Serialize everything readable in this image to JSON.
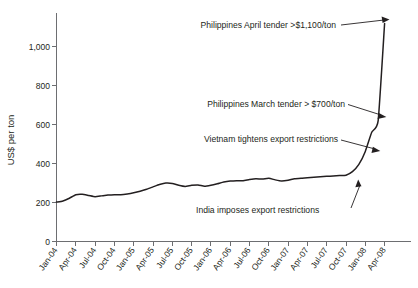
{
  "chart_data": {
    "type": "line",
    "title": "",
    "xlabel": "",
    "ylabel": "US$ per ton",
    "ylim": [
      0,
      1150
    ],
    "yticks": [
      "0",
      "200",
      "400",
      "600",
      "800",
      "1,000"
    ],
    "ytick_values": [
      0,
      200,
      400,
      600,
      800,
      1000
    ],
    "grid": false,
    "legend": "none",
    "categories": [
      "Jan-04",
      "Feb-04",
      "Mar-04",
      "Apr-04",
      "May-04",
      "Jun-04",
      "Jul-04",
      "Aug-04",
      "Sep-04",
      "Oct-04",
      "Nov-04",
      "Dec-04",
      "Jan-05",
      "Feb-05",
      "Mar-05",
      "Apr-05",
      "May-05",
      "Jun-05",
      "Jul-05",
      "Aug-05",
      "Sep-05",
      "Oct-05",
      "Nov-05",
      "Dec-05",
      "Jan-06",
      "Feb-06",
      "Mar-06",
      "Apr-06",
      "May-06",
      "Jun-06",
      "Jul-06",
      "Aug-06",
      "Sep-06",
      "Oct-06",
      "Nov-06",
      "Dec-06",
      "Jan-07",
      "Feb-07",
      "Mar-07",
      "Apr-07",
      "May-07",
      "Jun-07",
      "Jul-07",
      "Aug-07",
      "Sep-07",
      "Oct-07",
      "Nov-07",
      "Dec-07",
      "Jan-08",
      "Feb-08",
      "Mar-08",
      "Apr-08"
    ],
    "xticks": [
      "Jan-04",
      "Apr-04",
      "Jul-04",
      "Oct-04",
      "Jan-05",
      "Apr-05",
      "Jul-05",
      "Oct-05",
      "Jan-06",
      "Apr-06",
      "Jul-06",
      "Oct-06",
      "Jan-07",
      "Apr-07",
      "Jul-07",
      "Oct-07",
      "Jan-08",
      "Apr-08"
    ],
    "values": [
      202,
      208,
      222,
      240,
      242,
      236,
      230,
      234,
      238,
      240,
      240,
      244,
      250,
      258,
      268,
      280,
      292,
      300,
      298,
      288,
      282,
      288,
      290,
      283,
      288,
      296,
      305,
      310,
      312,
      312,
      318,
      322,
      320,
      324,
      316,
      310,
      314,
      322,
      325,
      327,
      330,
      332,
      334,
      336,
      338,
      340,
      358,
      395,
      462,
      560,
      620,
      1118
    ],
    "series_name": "Rice price",
    "line_color": "#231f20",
    "annotations": [
      {
        "id": "philippines-april",
        "text": "Philippines April tender >$1,100/ton",
        "point_label": "Apr-08",
        "point_value": 1118
      },
      {
        "id": "philippines-march",
        "text": "Philippines March tender > $700/ton",
        "point_label": "Mar-08",
        "point_value": 620
      },
      {
        "id": "vietnam-restrictions",
        "text": "Vietnam tightens export restrictions",
        "point_label": "Jan-08",
        "point_value": 462
      },
      {
        "id": "india-restrictions",
        "text": "India imposes export restrictions",
        "point_label": "Oct-07",
        "point_value": 340
      }
    ]
  }
}
